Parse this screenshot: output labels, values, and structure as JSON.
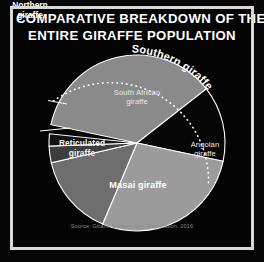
{
  "frame": {
    "border_color": "#d8d8d8",
    "background_color": "#040404"
  },
  "title": {
    "line1": "COMPARATIVE BREAKDOWN OF THE",
    "line2": "ENTIRE GIRAFFE POPULATION",
    "color": "#ffffff"
  },
  "grouping": {
    "label": "Southern giraffe",
    "style": "dotted-arc-bracket",
    "color": "#ffffff"
  },
  "source": {
    "text": "Source: Giraffe Conservation Foundation, 2016",
    "color": "#8c8c8c"
  },
  "labels": {
    "south_african": "South African\ngiraffe",
    "south_african_line1": "South African",
    "south_african_line2": "giraffe",
    "angolan_line1": "Angolan",
    "angolan_line2": "giraffe",
    "masai": "Masai giraffe",
    "reticulated_line1": "Reticulated",
    "reticulated_line2": "giraffe",
    "northern_line1": "Northern",
    "northern_line2": "giraffe"
  },
  "chart_data": {
    "type": "pie",
    "title": "COMPARATIVE BREAKDOWN OF THE ENTIRE GIRAFFE POPULATION",
    "subtitle": "",
    "xlabel": "",
    "ylabel": "",
    "grid": false,
    "legend_position": "in-slice-labels",
    "source": "Source: Giraffe Conservation Foundation, 2016",
    "center": {
      "x": 137,
      "y": 143
    },
    "radius": 88,
    "start_angle_deg": -78,
    "direction": "clockwise",
    "categories": [
      "South African giraffe",
      "Angolan giraffe",
      "Masai giraffe",
      "Reticulated giraffe",
      "Northern giraffe (sliver A)",
      "Northern giraffe (sliver B)"
    ],
    "values": [
      36,
      14,
      28,
      15,
      4,
      3
    ],
    "slices": [
      {
        "label": "South African giraffe",
        "value": 36,
        "color": "#8a8a8a",
        "start_angle_deg": -78,
        "end_angle_deg": 52,
        "label_placement": "inside",
        "label_lines": [
          "South African",
          "giraffe"
        ]
      },
      {
        "label": "Angolan giraffe",
        "value": 14,
        "color": "#060606",
        "start_angle_deg": 52,
        "end_angle_deg": 102,
        "label_placement": "inside",
        "label_lines": [
          "Angolan",
          "giraffe"
        ]
      },
      {
        "label": "Masai giraffe",
        "value": 28,
        "color": "#9b9b9b",
        "start_angle_deg": 102,
        "end_angle_deg": 203,
        "label_placement": "inside",
        "label_lines": [
          "Masai giraffe"
        ]
      },
      {
        "label": "Reticulated giraffe",
        "value": 15,
        "color": "#6e6e6e",
        "start_angle_deg": 203,
        "end_angle_deg": 257,
        "label_placement": "inside",
        "label_lines": [
          "Reticulated",
          "giraffe"
        ]
      },
      {
        "label": "Northern giraffe (sliver A)",
        "value": 4,
        "color": "#3d3d3d",
        "start_angle_deg": 257,
        "end_angle_deg": 268,
        "label_placement": "outside-left",
        "label_lines": [
          "Northern",
          "giraffe"
        ]
      },
      {
        "label": "Northern giraffe (sliver B)",
        "value": 3,
        "color": "#121212",
        "start_angle_deg": 268,
        "end_angle_deg": 276,
        "label_placement": "outside-left",
        "label_lines": [
          "Northern",
          "giraffe"
        ]
      }
    ],
    "group_bracket": {
      "label": "Southern giraffe",
      "members": [
        "South African giraffe",
        "Angolan giraffe"
      ],
      "style": "dotted arc outside the pie",
      "arc_start_angle_deg": -78,
      "arc_end_angle_deg": 102
    }
  }
}
